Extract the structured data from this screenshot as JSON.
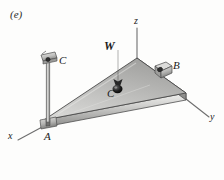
{
  "figure": {
    "part_label": "(e)",
    "caption_letter": "e",
    "background_color": "#fdfdfc",
    "ink_color": "#1a1a1a"
  },
  "axes": {
    "x": {
      "label": "x",
      "x": 8,
      "y": 131
    },
    "y": {
      "label": "y",
      "x": 210,
      "y": 112
    },
    "z": {
      "label": "z",
      "x": 134,
      "y": 16
    },
    "line_color": "#707070"
  },
  "points": {
    "a": {
      "label": "A",
      "x": 44,
      "y": 131,
      "role": "ball-and-socket-support"
    },
    "b": {
      "label": "B",
      "x": 173,
      "y": 60,
      "role": "bearing-block-support"
    },
    "c_top": {
      "label": "C",
      "x": 59,
      "y": 55,
      "role": "cable-anchor-bracket"
    },
    "c_cg": {
      "label": "C",
      "x": 107,
      "y": 88,
      "role": "center-of-gravity"
    }
  },
  "force": {
    "w": {
      "label": "W",
      "x": 104,
      "y": 40,
      "direction": "downward",
      "applied_at": "center-of-gravity C"
    }
  },
  "plate": {
    "shape": "triangular",
    "top_fill_light": "#d7d7d5",
    "top_fill_dark": "#a8a8a6",
    "edge_fill_light": "#e6e6e4",
    "edge_fill_dark": "#8e8e8c",
    "outline": "#4a4a4a",
    "thickness_px": 7
  },
  "cable": {
    "from": "c_top",
    "to": "a",
    "color_light": "#c9c9c7",
    "color_dark": "#8d8d8b"
  }
}
